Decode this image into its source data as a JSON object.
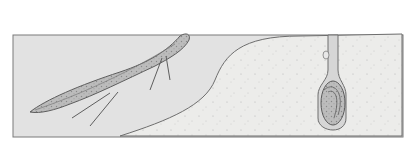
{
  "illustration": {
    "subject": "lungfish swimming in water and aestivating inside a mud burrow",
    "colors": {
      "background": "#ffffff",
      "water": "#e2e2e2",
      "mud": "#ececea",
      "outline": "#6e6e6e",
      "fish": "#bcbcbc",
      "fish_dark": "#8f8f8f",
      "burrow_tube": "#d6d6d6",
      "cocoon": "#a8a8a8"
    }
  }
}
